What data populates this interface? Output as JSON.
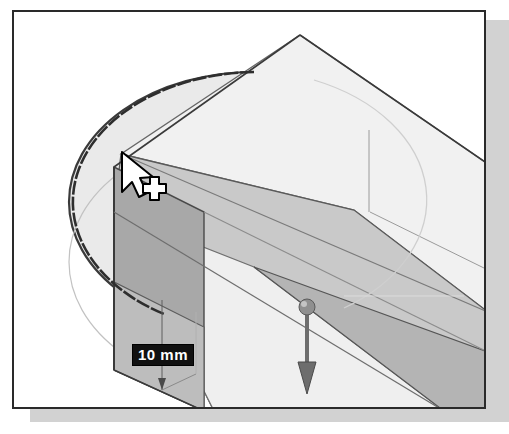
{
  "application": {
    "name": "3D CAD modeler viewport",
    "operation": "extrude-preview"
  },
  "viewport": {
    "background_color": "#ffffff",
    "frame_color": "#2a2a2a",
    "shadow_color": "#d2d2d2"
  },
  "model": {
    "sketch_shape": "ellipse",
    "solid_shape": "rectangular-block",
    "ellipse_fill": "#eaeaea",
    "ellipse_stroke": "#3a3a3a",
    "face_top": "#c9c9c9",
    "face_front": "#a8a8a8",
    "face_light": "#f0f0f0",
    "face_mid": "#dcdcdc",
    "edge_color": "#555555"
  },
  "dimension": {
    "value": "10 mm",
    "text_color": "#ffffff",
    "background_color": "#111111",
    "leader_color": "#555555"
  },
  "manipulator": {
    "type": "drag-arrow",
    "direction": "down",
    "handle": "sphere-grip",
    "color": "#6d6d6d"
  },
  "cursor": {
    "type": "arrow-with-crosshair",
    "fill": "#ffffff",
    "stroke": "#000000"
  }
}
